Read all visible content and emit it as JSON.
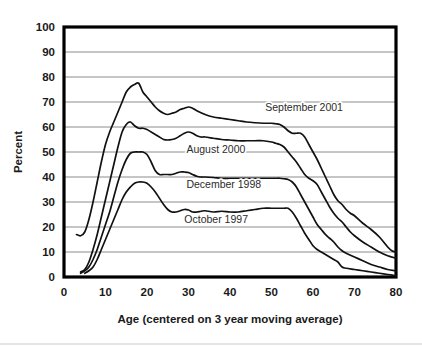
{
  "chart_data": {
    "type": "line",
    "title": "",
    "subtitle": "",
    "xlabel": "Age (centered on 3 year moving average)",
    "ylabel": "Percent",
    "xlim": [
      0,
      80
    ],
    "ylim": [
      0,
      100
    ],
    "xticks": [
      0,
      10,
      20,
      30,
      40,
      50,
      60,
      70,
      80
    ],
    "yticks": [
      0,
      10,
      20,
      30,
      40,
      50,
      60,
      70,
      80,
      90,
      100
    ],
    "grid": "horizontal",
    "legend_position": "inline-annotations",
    "line_color": "#111111",
    "gridline_color": "#8c8c8c",
    "frame_color": "#000000",
    "series": [
      {
        "name": "September 2001",
        "label": "September 2001",
        "label_x": 48.5,
        "label_y": 66.5,
        "x": [
          3,
          4,
          5,
          6,
          7,
          8,
          9,
          10,
          11,
          12,
          13,
          14,
          15,
          16,
          17,
          18,
          19,
          20,
          21,
          22,
          23,
          24,
          25,
          26,
          27,
          28,
          29,
          30,
          31,
          32,
          34,
          36,
          38,
          40,
          42,
          44,
          46,
          48,
          50,
          51,
          52,
          53,
          54,
          55,
          56,
          57,
          58,
          59,
          60,
          61,
          62,
          63,
          64,
          65,
          66,
          67,
          68,
          69,
          70,
          72,
          74,
          76,
          78,
          79,
          80
        ],
        "y": [
          17,
          16.5,
          18,
          23,
          30,
          38,
          46,
          53,
          58,
          62,
          66,
          70,
          74,
          76,
          77,
          77.5,
          74,
          72,
          70,
          68,
          66.5,
          65.5,
          65,
          65.5,
          66,
          67,
          67.5,
          68,
          67.5,
          66.5,
          65,
          64,
          63.5,
          63,
          62.5,
          62,
          61.7,
          61.5,
          61.5,
          61.3,
          61,
          60,
          58.5,
          57.5,
          57.5,
          57.5,
          56,
          53,
          50,
          47,
          43.5,
          40,
          36.5,
          33,
          30.5,
          29,
          27,
          25.5,
          24.5,
          21.5,
          19,
          16,
          12,
          10.5,
          10
        ]
      },
      {
        "name": "August 2000",
        "label": "August 2000",
        "label_x": 29.5,
        "label_y": 49.5,
        "x": [
          4,
          5,
          6,
          7,
          8,
          9,
          10,
          11,
          12,
          13,
          14,
          15,
          16,
          17,
          18,
          19,
          20,
          21,
          22,
          23,
          24,
          25,
          26,
          27,
          28,
          29,
          30,
          31,
          32,
          33,
          34,
          36,
          38,
          40,
          42,
          44,
          46,
          48,
          50,
          51,
          52,
          53,
          54,
          55,
          56,
          57,
          58,
          59,
          60,
          61,
          62,
          63,
          64,
          65,
          66,
          67,
          68,
          69,
          70,
          72,
          74,
          76,
          78,
          80
        ],
        "y": [
          2,
          3,
          6,
          11,
          17,
          24,
          31,
          38,
          45,
          52,
          58,
          61,
          62,
          60.5,
          59.5,
          59.5,
          59,
          58,
          57,
          56,
          55,
          54.8,
          55,
          55.5,
          56.5,
          57.5,
          58,
          57.5,
          56.5,
          56,
          56,
          55.5,
          55,
          54.8,
          54.5,
          54.5,
          54.5,
          54.5,
          54,
          53.5,
          53,
          52,
          50,
          48,
          46,
          43.5,
          41,
          39.5,
          38.5,
          37,
          34,
          31,
          28,
          25.5,
          23.5,
          22,
          20,
          18,
          16.5,
          14,
          12,
          10,
          8.5,
          7.5
        ]
      },
      {
        "name": "December 1998",
        "label": "December 1998",
        "label_x": 29.5,
        "label_y": 35.5,
        "x": [
          4,
          5,
          6,
          7,
          8,
          9,
          10,
          11,
          12,
          13,
          14,
          15,
          16,
          17,
          18,
          19,
          20,
          21,
          22,
          23,
          24,
          25,
          26,
          27,
          28,
          29,
          30,
          31,
          32,
          33,
          34,
          36,
          38,
          40,
          42,
          44,
          46,
          48,
          50,
          51,
          52,
          53,
          54,
          55,
          56,
          57,
          58,
          59,
          60,
          61,
          62,
          63,
          64,
          65,
          66,
          67,
          68,
          70,
          72,
          74,
          76,
          78,
          80
        ],
        "y": [
          1.5,
          2.5,
          4,
          7,
          11,
          16,
          21,
          26,
          32,
          38,
          43,
          47,
          49.5,
          50,
          50,
          50,
          49,
          46,
          42.5,
          41,
          41,
          41,
          41,
          41.5,
          42,
          42,
          41.8,
          41,
          40.3,
          40,
          40,
          39.8,
          39.5,
          39.5,
          39.5,
          39.5,
          39.5,
          39.5,
          39.5,
          39.5,
          39.5,
          39.3,
          39,
          38,
          36,
          33,
          30,
          27,
          24,
          21,
          19,
          17,
          15.5,
          14,
          12,
          10.5,
          9.5,
          8,
          6.5,
          5,
          4,
          3,
          2.5
        ]
      },
      {
        "name": "October 1997",
        "label": "October 1997",
        "label_x": 29.0,
        "label_y": 21.5,
        "x": [
          5,
          6,
          7,
          8,
          9,
          10,
          11,
          12,
          13,
          14,
          15,
          16,
          17,
          18,
          19,
          20,
          21,
          22,
          23,
          24,
          25,
          26,
          27,
          28,
          29,
          30,
          31,
          32,
          33,
          34,
          36,
          38,
          40,
          42,
          44,
          46,
          48,
          50,
          51,
          52,
          53,
          54,
          55,
          56,
          57,
          58,
          59,
          60,
          61,
          62,
          63,
          64,
          65,
          66,
          67,
          68,
          70,
          72,
          74,
          76,
          78,
          80
        ],
        "y": [
          1.5,
          2.5,
          4,
          7,
          11,
          15,
          19,
          23,
          27,
          31,
          34,
          36,
          37.5,
          38,
          38,
          37.5,
          36,
          34,
          31.5,
          29,
          27,
          26,
          26,
          26.5,
          27,
          26.8,
          26,
          26,
          26.3,
          26.5,
          26,
          26.3,
          26,
          26,
          26.5,
          27,
          27.5,
          27.5,
          27.5,
          27.5,
          27.5,
          27.5,
          26,
          23.5,
          20.5,
          17.5,
          15,
          12.5,
          11,
          10,
          9,
          8,
          7,
          6,
          4,
          3.5,
          3,
          2.5,
          2,
          1.5,
          1,
          0.5
        ]
      }
    ]
  },
  "axes": {
    "y_title": "Percent",
    "x_title": "Age (centered on 3 year moving average)",
    "y_tick_labels": [
      "100",
      "90",
      "80",
      "70",
      "60",
      "50",
      "40",
      "30",
      "20",
      "10",
      "0"
    ],
    "x_tick_labels": [
      "0",
      "10",
      "20",
      "30",
      "40",
      "50",
      "60",
      "70",
      "80"
    ]
  }
}
